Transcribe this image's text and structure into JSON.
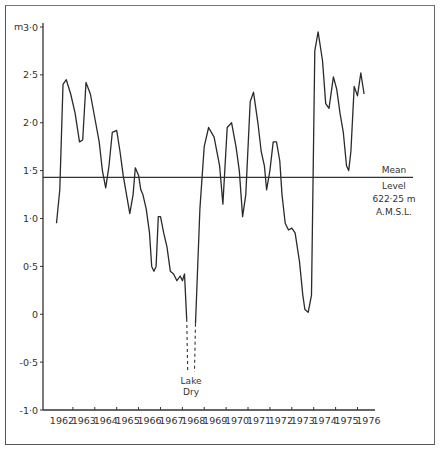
{
  "chart_data": {
    "type": "line",
    "title": "",
    "xlabel": "",
    "ylabel": "m",
    "ylim": [
      -1.0,
      3.0
    ],
    "xlim": [
      1962,
      1976.8
    ],
    "grid": false,
    "legend": null,
    "y_ticks": [
      "3.0",
      "2.5",
      "2.0",
      "1.5",
      "1.0",
      "0.5",
      "0",
      "-0.5",
      "-1.0"
    ],
    "y_tick_values": [
      3.0,
      2.5,
      2.0,
      1.5,
      1.0,
      0.5,
      0,
      -0.5,
      -1.0
    ],
    "x_ticks": [
      "1962",
      "1963",
      "1964",
      "1965",
      "1966",
      "1967",
      "1968",
      "1969",
      "1970",
      "1971",
      "1972",
      "1973",
      "1974",
      "1975",
      "1976"
    ],
    "reference_line": {
      "value": 1.43,
      "label_lines": [
        "Mean",
        "Level",
        "622·25 m",
        "A.M.S.L."
      ]
    },
    "gap_annotation": {
      "label_lines": [
        "Lake",
        "Dry"
      ],
      "start_year": 1968.2,
      "end_year": 1968.6
    },
    "series": [
      {
        "name": "Lake level",
        "segments": [
          {
            "x": [
              1962.25,
              1962.4,
              1962.55,
              1962.7,
              1962.9,
              1963.1,
              1963.3,
              1963.45,
              1963.6,
              1963.8,
              1964.0,
              1964.2,
              1964.35,
              1964.5,
              1964.65,
              1964.8,
              1965.0,
              1965.15,
              1965.3,
              1965.45,
              1965.6,
              1965.75,
              1965.85,
              1966.0,
              1966.1,
              1966.2,
              1966.35,
              1966.5,
              1966.6,
              1966.7,
              1966.8,
              1966.9,
              1967.0,
              1967.15,
              1967.3,
              1967.45,
              1967.6,
              1967.75,
              1967.9,
              1968.0,
              1968.1,
              1968.2
            ],
            "y": [
              0.95,
              1.3,
              2.4,
              2.45,
              2.3,
              2.1,
              1.8,
              1.82,
              2.42,
              2.3,
              2.05,
              1.8,
              1.5,
              1.32,
              1.55,
              1.9,
              1.92,
              1.7,
              1.45,
              1.25,
              1.05,
              1.25,
              1.53,
              1.45,
              1.3,
              1.25,
              1.1,
              0.85,
              0.5,
              0.45,
              0.5,
              1.02,
              1.02,
              0.85,
              0.7,
              0.45,
              0.42,
              0.35,
              0.4,
              0.35,
              0.42,
              -0.05
            ]
          },
          {
            "x": [
              1968.6,
              1968.8,
              1969.0,
              1969.2,
              1969.45,
              1969.7,
              1969.85,
              1970.05,
              1970.25,
              1970.45,
              1970.6,
              1970.75,
              1970.9,
              1971.1,
              1971.25,
              1971.45,
              1971.6,
              1971.75,
              1971.85,
              1972.0,
              1972.15,
              1972.3,
              1972.45,
              1972.55,
              1972.7,
              1972.85,
              1973.0,
              1973.15,
              1973.35,
              1973.5,
              1973.6,
              1973.75,
              1973.9,
              1974.05,
              1974.2,
              1974.4,
              1974.55,
              1974.7,
              1974.9,
              1975.05,
              1975.2,
              1975.35,
              1975.5,
              1975.6,
              1975.7,
              1975.85,
              1976.0,
              1976.15,
              1976.3
            ],
            "y": [
              -0.1,
              1.1,
              1.75,
              1.95,
              1.85,
              1.55,
              1.15,
              1.95,
              2.0,
              1.75,
              1.5,
              1.02,
              1.25,
              2.22,
              2.32,
              2.0,
              1.7,
              1.55,
              1.3,
              1.5,
              1.8,
              1.8,
              1.6,
              1.25,
              0.95,
              0.88,
              0.9,
              0.85,
              0.55,
              0.2,
              0.05,
              0.02,
              0.2,
              2.75,
              2.95,
              2.65,
              2.2,
              2.15,
              2.48,
              2.35,
              2.1,
              1.9,
              1.55,
              1.5,
              1.7,
              2.38,
              2.28,
              2.52,
              2.3
            ]
          }
        ]
      }
    ]
  }
}
